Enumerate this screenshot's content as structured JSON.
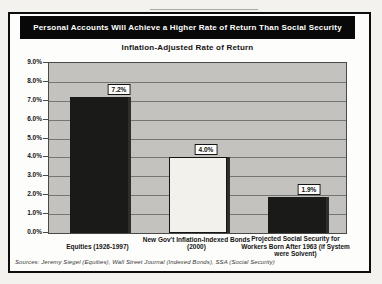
{
  "header": {
    "title": "Personal Accounts Will Achieve a Higher Rate of Return Than Social Security",
    "subtitle": "Inflation-Adjusted Rate of Return"
  },
  "chart_data": {
    "type": "bar",
    "title": "Inflation-Adjusted Rate of Return",
    "categories": [
      "Equities (1926-1997)",
      "New Gov't Inflation-Indexed Bonds (2000)",
      "Projected Social Security for Workers Born After 1963 (if System were Solvent)"
    ],
    "values": [
      7.2,
      4.0,
      1.9
    ],
    "value_labels": [
      "7.2%",
      "4.0%",
      "1.9%"
    ],
    "bar_colors": [
      "#1a1a18",
      "#f2f1ec",
      "#1a1a18"
    ],
    "ylim": [
      0,
      9
    ],
    "y_tick_step": 1.0,
    "y_ticks": [
      "9.0%",
      "8.0%",
      "7.0%",
      "6.0%",
      "5.0%",
      "4.0%",
      "3.0%",
      "2.0%",
      "1.0%",
      "0.0%"
    ],
    "grid": true,
    "legend": "none",
    "plot_bg": "#c3c2bf",
    "gridline_color": "#757572"
  },
  "footer": {
    "source": "Sources:  Jeremy Siegel (Equities),  Wall Street Journal (Indexed Bonds), SSA (Social Security)"
  },
  "colors": {
    "banner_bg": "#080808",
    "banner_text": "#ffffff",
    "frame_border": "#0d0d0d"
  }
}
